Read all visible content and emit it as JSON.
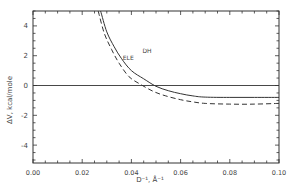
{
  "chart_data": {
    "type": "line",
    "title": "",
    "xlabel": "D⁻¹, Å⁻¹",
    "ylabel": "ΔV, kcal/mole",
    "xlim": [
      0.0,
      0.1
    ],
    "ylim": [
      -5.2,
      5
    ],
    "x_ticks": [
      "0.00",
      "0.02",
      "0.04",
      "0.06",
      "0.08",
      "0.10"
    ],
    "y_ticks": [
      "4",
      "2",
      "0",
      "-2",
      "-4"
    ],
    "grid": false,
    "legend_position": "inline labels",
    "reference_line": {
      "y": 0,
      "style": "solid"
    },
    "series": [
      {
        "name": "DH",
        "style": "solid",
        "label_pos": {
          "x": 0.0445,
          "y": 2.2
        },
        "x": [
          0.0275,
          0.03,
          0.033,
          0.036,
          0.04,
          0.045,
          0.05,
          0.055,
          0.06,
          0.065,
          0.07,
          0.08,
          0.09,
          0.1
        ],
        "y": [
          5.0,
          3.6,
          2.6,
          1.8,
          1.0,
          0.45,
          -0.05,
          -0.35,
          -0.55,
          -0.7,
          -0.78,
          -0.8,
          -0.8,
          -0.8
        ]
      },
      {
        "name": "ELE",
        "style": "dashed",
        "label_pos": {
          "x": 0.0365,
          "y": 1.7
        },
        "x": [
          0.0265,
          0.029,
          0.032,
          0.035,
          0.039,
          0.044,
          0.049,
          0.054,
          0.06,
          0.065,
          0.07,
          0.08,
          0.09,
          0.1
        ],
        "y": [
          5.0,
          3.5,
          2.4,
          1.5,
          0.6,
          0.05,
          -0.4,
          -0.7,
          -0.95,
          -1.1,
          -1.2,
          -1.25,
          -1.25,
          -1.2
        ]
      }
    ]
  }
}
